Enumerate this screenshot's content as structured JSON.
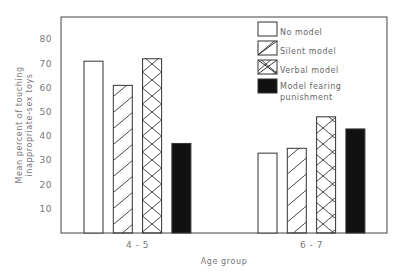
{
  "chart_data": {
    "type": "bar",
    "title": "",
    "xlabel": "Age group",
    "ylabel": [
      "Mean percent of touching",
      "inappropriate-sex toys"
    ],
    "categories": [
      "4-5",
      "6-7"
    ],
    "series": [
      {
        "name": "No model",
        "pattern": "empty",
        "values": [
          71,
          33
        ]
      },
      {
        "name": "Silent model",
        "pattern": "diagonal",
        "values": [
          61,
          35
        ]
      },
      {
        "name": "Verbal model",
        "pattern": "crosshatch",
        "values": [
          72,
          48
        ]
      },
      {
        "name": "Model fearing punishment",
        "pattern": "solid",
        "values": [
          37,
          43
        ]
      }
    ],
    "yticks": [
      10,
      20,
      30,
      40,
      50,
      60,
      70,
      80
    ],
    "ylim": [
      0,
      89
    ],
    "grid": false,
    "legend_position": "upper right, inside plot",
    "colors": {
      "stroke": "#333333",
      "solid_fill": "#111111",
      "background": "#ffffff"
    }
  },
  "legend": {
    "items": [
      {
        "label_lines": [
          "No model"
        ]
      },
      {
        "label_lines": [
          "Silent model"
        ]
      },
      {
        "label_lines": [
          "Verbal model"
        ]
      },
      {
        "label_lines": [
          "Model fearing",
          "punishment"
        ]
      }
    ]
  }
}
